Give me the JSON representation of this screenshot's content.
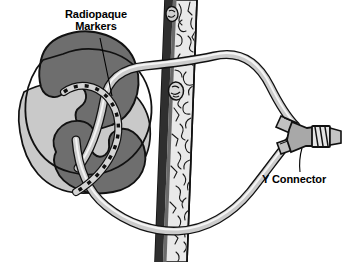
{
  "figure": {
    "background_color": "#ffffff",
    "width": 346,
    "height": 262
  },
  "labels": {
    "radiopaque": {
      "text": "Radiopaque\nMarkers",
      "line1": "Radiopaque",
      "line2": "Markers",
      "color": "#000000"
    },
    "y_connector": {
      "text": "Y Connector",
      "color": "#000000"
    }
  },
  "anatomy": {
    "kidney": {
      "name": "kidney",
      "cortex_color": "#6e6e6e",
      "pelvis_color": "#c9c9c9",
      "outline_color": "#111111"
    },
    "spine": {
      "name": "vertebral-column",
      "bone_color": "#e8e8e8",
      "shadow_color": "#3a3a3a",
      "outline_color": "#111111"
    }
  },
  "device": {
    "catheter": {
      "name": "catheter-tubing",
      "fill_color": "#cfcfcf",
      "highlight_color": "#f2f2f2",
      "outline_color": "#111111"
    },
    "markers": {
      "name": "radiopaque-markers",
      "color": "#111111",
      "count": 12
    },
    "connector": {
      "name": "y-connector",
      "fill_color": "#b4b4b4",
      "outline_color": "#111111"
    }
  },
  "leader_lines": {
    "radiopaque_leader": {
      "color": "#000000",
      "width": 1
    },
    "y_connector_leader": {
      "color": "#000000",
      "width": 1
    }
  }
}
